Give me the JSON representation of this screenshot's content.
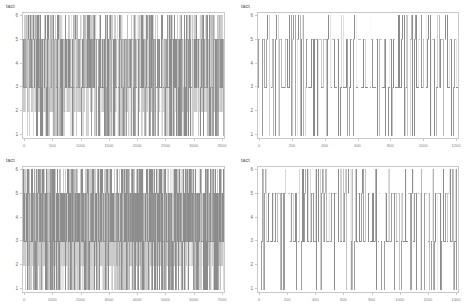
{
  "figure": {
    "layout": "2x2 grid of step-trace panels",
    "background": "#ffffff",
    "frame_color": "#c9c9c9",
    "trace_color": "#8c8c8c"
  },
  "panels": [
    {
      "id": "panel-top-left",
      "title": "tact",
      "ylabel": "tact",
      "yticks": [
        "6",
        "5",
        "4",
        "3",
        "2",
        "1"
      ],
      "xticks": [
        "0",
        "500",
        "1000",
        "1500",
        "2000",
        "2500",
        "3000",
        "3500"
      ],
      "density": "very-dense"
    },
    {
      "id": "panel-top-right",
      "title": "tact",
      "ylabel": "tact",
      "yticks": [
        "6",
        "5",
        "4",
        "3",
        "2",
        "1"
      ],
      "xticks": [
        "0",
        "200",
        "400",
        "600",
        "800",
        "1000",
        "1200"
      ],
      "density": "sparse"
    },
    {
      "id": "panel-bottom-left",
      "title": "tact",
      "ylabel": "tact",
      "yticks": [
        "6",
        "5",
        "4",
        "3",
        "2",
        "1"
      ],
      "xticks": [
        "0",
        "1000",
        "2000",
        "3000",
        "4000",
        "5000",
        "6000",
        "7000"
      ],
      "density": "very-dense"
    },
    {
      "id": "panel-bottom-right",
      "title": "tact",
      "ylabel": "tact",
      "yticks": [
        "6",
        "5",
        "4",
        "3",
        "2",
        "1"
      ],
      "xticks": [
        "0",
        "200",
        "400",
        "600",
        "800",
        "1000",
        "1200",
        "1400"
      ],
      "density": "medium"
    }
  ],
  "chart_data": [
    {
      "type": "line",
      "title": "tact",
      "xlabel": "",
      "ylabel": "tact",
      "ylim": [
        1,
        6
      ],
      "xlim": [
        0,
        3500
      ],
      "grid": false,
      "legend": "none",
      "style": "step",
      "yticks": [
        1,
        2,
        3,
        4,
        5,
        6
      ],
      "xticks": [
        0,
        500,
        1000,
        1500,
        2000,
        2500,
        3000,
        3500
      ],
      "series": [
        {
          "name": "tact",
          "description": "dense square-wave oscillation between levels 1 and 6, with plateaus at 3 and 5; pulse count approx 120, duty varying",
          "levels": [
            1,
            3,
            5,
            6
          ],
          "n_pulses": 120,
          "peak_level": 6,
          "base_level": 1
        }
      ]
    },
    {
      "type": "line",
      "title": "tact",
      "xlabel": "",
      "ylabel": "tact",
      "ylim": [
        1,
        6
      ],
      "xlim": [
        0,
        1200
      ],
      "grid": false,
      "legend": "none",
      "style": "step",
      "yticks": [
        1,
        2,
        3,
        4,
        5,
        6
      ],
      "xticks": [
        0,
        200,
        400,
        600,
        800,
        1000,
        1200
      ],
      "series": [
        {
          "name": "tact",
          "description": "regular sparse square-wave between 1 and 6 with intermediate holds at 3 and 5; approx 46 pulses evenly spaced",
          "levels": [
            1,
            3,
            5,
            6
          ],
          "n_pulses": 46,
          "peak_level": 6,
          "base_level": 1
        }
      ]
    },
    {
      "type": "line",
      "title": "tact",
      "xlabel": "",
      "ylabel": "tact",
      "ylim": [
        1,
        6
      ],
      "xlim": [
        0,
        7000
      ],
      "grid": false,
      "legend": "none",
      "style": "step",
      "yticks": [
        1,
        2,
        3,
        4,
        5,
        6
      ],
      "xticks": [
        0,
        1000,
        2000,
        3000,
        4000,
        5000,
        6000,
        7000
      ],
      "series": [
        {
          "name": "tact",
          "description": "extremely dense square-wave filling the panel, levels 1 through 6 with heavy overlap at 3 and 5",
          "levels": [
            1,
            3,
            5,
            6
          ],
          "n_pulses": 160,
          "peak_level": 6,
          "base_level": 1
        }
      ]
    },
    {
      "type": "line",
      "title": "tact",
      "xlabel": "",
      "ylabel": "tact",
      "ylim": [
        1,
        6
      ],
      "xlim": [
        0,
        1400
      ],
      "grid": false,
      "legend": "none",
      "style": "step",
      "yticks": [
        1,
        2,
        3,
        4,
        5,
        6
      ],
      "xticks": [
        0,
        200,
        400,
        600,
        800,
        1000,
        1200,
        1400
      ],
      "series": [
        {
          "name": "tact",
          "description": "medium-density square-wave between 1 and 6, plateaus at 3 and 5, roughly 60 pulses",
          "levels": [
            1,
            3,
            5,
            6
          ],
          "n_pulses": 60,
          "peak_level": 6,
          "base_level": 1
        }
      ]
    }
  ]
}
